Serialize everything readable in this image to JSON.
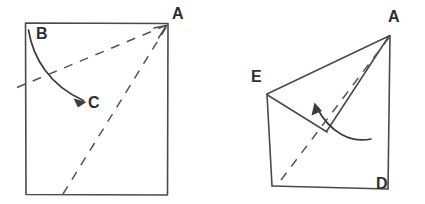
{
  "figure": {
    "canvas": {
      "width": 425,
      "height": 204,
      "background": "#ffffff"
    },
    "ink_color": "#4a4a50",
    "label_color": "#2e2e33",
    "panels": [
      {
        "id": "left-panel",
        "name": "unfolded-square",
        "labels": [
          {
            "id": "label-A-left",
            "text": "A",
            "x": 172,
            "y": 6
          },
          {
            "id": "label-B-left",
            "text": "B",
            "x": 36,
            "y": 26
          },
          {
            "id": "label-C-left",
            "text": "C",
            "x": 88,
            "y": 95
          }
        ],
        "square": {
          "left": 25,
          "top": 23,
          "right": 168,
          "bottom": 195
        },
        "fold_lines": [
          {
            "id": "crease-upper",
            "from_x": 17,
            "from_y": 87,
            "to_x": 167,
            "to_y": 25
          },
          {
            "id": "crease-lower",
            "from_x": 63,
            "from_y": 194,
            "to_x": 167,
            "to_y": 26
          }
        ],
        "motion_arrow": {
          "id": "fold-arrow-B-to-C",
          "description": "curved arrow from B down to C"
        }
      },
      {
        "id": "right-panel",
        "name": "folded-shape",
        "labels": [
          {
            "id": "label-A-right",
            "text": "A",
            "x": 388,
            "y": 9
          },
          {
            "id": "label-E-right",
            "text": "E",
            "x": 251,
            "y": 69
          },
          {
            "id": "label-D-right",
            "text": "D",
            "x": 376,
            "y": 176
          }
        ],
        "vertices": [
          {
            "id": "vertex-A",
            "x": 390,
            "y": 35
          },
          {
            "id": "vertex-E",
            "x": 267,
            "y": 94
          },
          {
            "id": "vertex-D",
            "x": 388,
            "y": 189
          },
          {
            "id": "vertex-corner-bottom-left",
            "x": 272,
            "y": 186
          },
          {
            "id": "vertex-fold-tip",
            "x": 327,
            "y": 132
          }
        ],
        "fold_lines": [
          {
            "id": "crease-dashed",
            "from_x": 282,
            "from_y": 180,
            "to_x": 389,
            "to_y": 37
          }
        ],
        "motion_arrow": {
          "id": "unfold-arrow",
          "description": "curved arrow sweeping from lower right up to the left"
        }
      }
    ]
  }
}
